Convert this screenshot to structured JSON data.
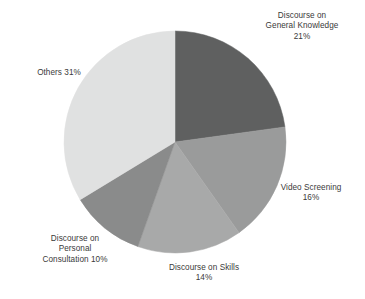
{
  "chart_data": {
    "type": "pie",
    "title": "",
    "subtitle": "",
    "xlabel": "",
    "ylabel": "",
    "grid": false,
    "legend": "none",
    "label_format": "name + percent",
    "start_angle_deg": 0,
    "direction": "clockwise",
    "background_color": "#ffffff",
    "label_color": "#3a3a3a",
    "categories": [
      "Discourse on General Knowledge",
      "Video Screening",
      "Discourse on Skills",
      "Discourse on Personal Consultation",
      "Others"
    ],
    "values": [
      21,
      16,
      14,
      10,
      31
    ],
    "unit": "%",
    "total_labeled": 92,
    "slices": [
      {
        "name": "Discourse on General Knowledge",
        "value": 21,
        "percent_label": "21%",
        "color": "#5f6060",
        "label_lines": [
          "Discourse on",
          "General Knowledge",
          "21%"
        ],
        "label_text": "Discourse on\nGeneral Knowledge\n21%",
        "label_position": "top-right"
      },
      {
        "name": "Video Screening",
        "value": 16,
        "percent_label": "16%",
        "color": "#9a9b9b",
        "label_lines": [
          "Video Screening",
          "16%"
        ],
        "label_text": "Video Screening\n16%",
        "label_position": "right"
      },
      {
        "name": "Discourse on Skills",
        "value": 14,
        "percent_label": "14%",
        "color": "#a8a9a9",
        "label_lines": [
          "Discourse on Skills",
          "14%"
        ],
        "label_text": "Discourse on Skills\n14%",
        "label_position": "bottom"
      },
      {
        "name": "Discourse on Personal Consultation",
        "value": 10,
        "percent_label": "10%",
        "color": "#8a8b8b",
        "label_lines": [
          "Discourse on",
          "Personal",
          "Consultation 10%"
        ],
        "label_text": "Discourse on\nPersonal\nConsultation 10%",
        "label_position": "bottom-left"
      },
      {
        "name": "Others",
        "value": 31,
        "percent_label": "31%",
        "color": "#e0e1e1",
        "label_lines": [
          "Others 31%"
        ],
        "label_text": "Others 31%",
        "label_position": "left"
      }
    ],
    "geometry": {
      "center_x": 175,
      "center_y": 142,
      "radius": 111
    }
  }
}
